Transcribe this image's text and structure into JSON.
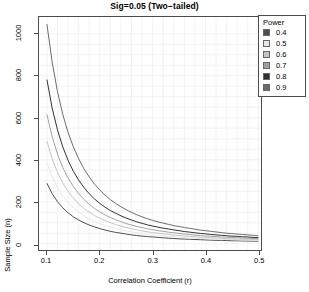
{
  "chart_data": {
    "type": "line",
    "title": "Sig=0.05 (Two−tailed)",
    "xlabel": "Correlation Coefficient (r)",
    "ylabel": "Sample Size (n)",
    "xlim": [
      0.085,
      0.505
    ],
    "ylim": [
      -30,
      1080
    ],
    "xticks": [
      0.1,
      0.2,
      0.3,
      0.4,
      0.5
    ],
    "xticklabels": [
      "0.1",
      "0.2",
      "0.3",
      "0.4",
      "0.5"
    ],
    "yticks": [
      0,
      200,
      400,
      600,
      800,
      1000
    ],
    "yticklabels": [
      "0",
      "200",
      "400",
      "600",
      "800",
      "1000"
    ],
    "grid": true,
    "grid_color": "#f2f2f2",
    "legend": {
      "title": "Power",
      "position": "top-right",
      "entries": [
        {
          "label": "0.4",
          "color": "#4d4d4d"
        },
        {
          "label": "0.5",
          "color": "#e8e8e8"
        },
        {
          "label": "0.6",
          "color": "#c4c4c4"
        },
        {
          "label": "0.7",
          "color": "#a0a0a0"
        },
        {
          "label": "0.8",
          "color": "#303030"
        },
        {
          "label": "0.9",
          "color": "#6b6b6b"
        }
      ]
    },
    "x": [
      0.1,
      0.11,
      0.12,
      0.13,
      0.14,
      0.15,
      0.16,
      0.17,
      0.18,
      0.19,
      0.2,
      0.21,
      0.22,
      0.23,
      0.24,
      0.25,
      0.26,
      0.27,
      0.28,
      0.29,
      0.3,
      0.31,
      0.32,
      0.33,
      0.34,
      0.35,
      0.36,
      0.37,
      0.38,
      0.39,
      0.4,
      0.41,
      0.42,
      0.43,
      0.44,
      0.45,
      0.46,
      0.47,
      0.48,
      0.49,
      0.5
    ],
    "series": [
      {
        "name": "0.4",
        "power": 0.4,
        "color": "#4d4d4d",
        "values": [
          288,
          238,
          200,
          171,
          147,
          128,
          113,
          100,
          89,
          80,
          72,
          65,
          59,
          54,
          50,
          46,
          42,
          39,
          36,
          34,
          32,
          30,
          28,
          26,
          25,
          23,
          22,
          21,
          20,
          19,
          18,
          17,
          16,
          16,
          15,
          14,
          14,
          13,
          13,
          12,
          12
        ]
      },
      {
        "name": "0.5",
        "power": 0.5,
        "color": "#e8e8e8",
        "values": [
          384,
          317,
          266,
          227,
          196,
          170,
          150,
          133,
          118,
          106,
          96,
          87,
          79,
          72,
          66,
          61,
          56,
          52,
          48,
          45,
          42,
          39,
          37,
          35,
          33,
          31,
          29,
          28,
          26,
          25,
          24,
          23,
          22,
          21,
          20,
          19,
          18,
          17,
          17,
          16,
          15
        ]
      },
      {
        "name": "0.6",
        "power": 0.6,
        "color": "#c4c4c4",
        "values": [
          489,
          404,
          339,
          289,
          249,
          217,
          190,
          168,
          150,
          134,
          121,
          110,
          100,
          91,
          84,
          77,
          71,
          66,
          61,
          57,
          53,
          50,
          47,
          44,
          41,
          39,
          37,
          35,
          33,
          31,
          30,
          28,
          27,
          26,
          24,
          23,
          22,
          21,
          21,
          20,
          19
        ]
      },
      {
        "name": "0.7",
        "power": 0.7,
        "color": "#a0a0a0",
        "values": [
          616,
          509,
          427,
          363,
          313,
          272,
          239,
          211,
          188,
          168,
          152,
          137,
          125,
          114,
          105,
          96,
          89,
          82,
          77,
          71,
          67,
          62,
          59,
          55,
          52,
          49,
          46,
          44,
          41,
          39,
          37,
          35,
          34,
          32,
          31,
          29,
          28,
          27,
          26,
          25,
          24
        ]
      },
      {
        "name": "0.8",
        "power": 0.8,
        "color": "#303030",
        "values": [
          782,
          645,
          542,
          461,
          397,
          345,
          303,
          268,
          238,
          213,
          192,
          174,
          158,
          145,
          133,
          122,
          113,
          104,
          97,
          90,
          84,
          79,
          74,
          70,
          66,
          62,
          58,
          55,
          52,
          49,
          47,
          44,
          42,
          40,
          38,
          36,
          35,
          33,
          32,
          30,
          29
        ]
      },
      {
        "name": "0.9",
        "power": 0.9,
        "color": "#6b6b6b",
        "values": [
          1046,
          863,
          724,
          616,
          530,
          461,
          405,
          357,
          318,
          284,
          256,
          231,
          210,
          192,
          176,
          162,
          149,
          138,
          128,
          119,
          111,
          104,
          98,
          92,
          86,
          82,
          77,
          73,
          69,
          65,
          62,
          59,
          56,
          53,
          50,
          48,
          46,
          44,
          42,
          40,
          38
        ]
      }
    ]
  }
}
